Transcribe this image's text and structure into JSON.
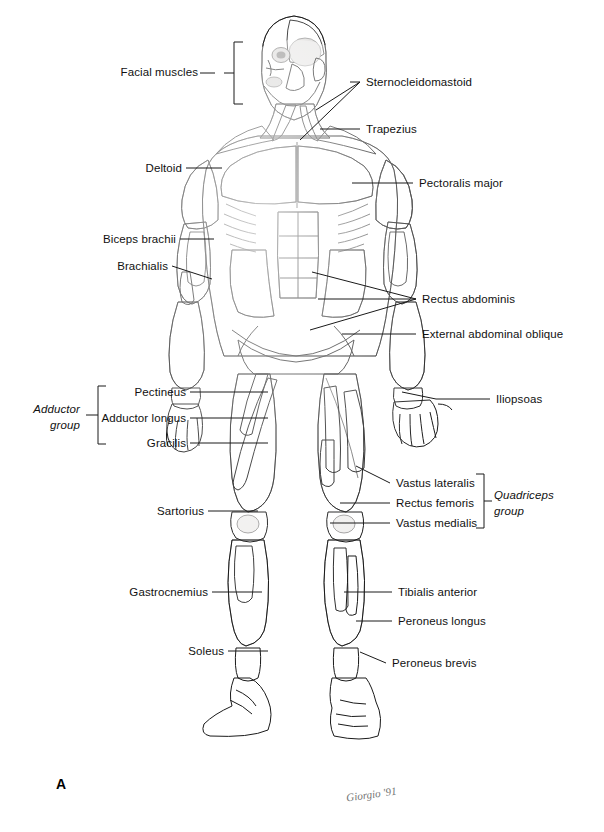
{
  "figure": {
    "panel_letter": "A",
    "view": "anterior",
    "signature": "Giorgio '91",
    "background_color": "#ffffff",
    "line_color": "#1a1a1a",
    "text_color": "#111111"
  },
  "labels_left": [
    {
      "id": "facial-muscles",
      "text": "Facial muscles",
      "x": 143,
      "y": 72,
      "type": "bracket"
    },
    {
      "id": "deltoid",
      "text": "Deltoid",
      "x": 140,
      "y": 164,
      "type": "line"
    },
    {
      "id": "biceps-brachii",
      "text": "Biceps brachii",
      "x": 101,
      "y": 235,
      "type": "line"
    },
    {
      "id": "brachialis",
      "text": "Brachialis",
      "x": 120,
      "y": 262,
      "type": "line"
    },
    {
      "id": "pectineus",
      "text": "Pectineus",
      "x": 129,
      "y": 389,
      "type": "line"
    },
    {
      "id": "adductor-longus",
      "text": "Adductor longus",
      "x": 90,
      "y": 415,
      "type": "line"
    },
    {
      "id": "gracilis",
      "text": "Gracilis",
      "x": 131,
      "y": 440,
      "type": "line"
    },
    {
      "id": "sartorius",
      "text": "Sartorius",
      "x": 158,
      "y": 508,
      "type": "line"
    },
    {
      "id": "gastrocnemius",
      "text": "Gastrocnemius",
      "x": 137,
      "y": 589,
      "type": "line"
    },
    {
      "id": "soleus",
      "text": "Soleus",
      "x": 194,
      "y": 648,
      "type": "line"
    }
  ],
  "labels_right": [
    {
      "id": "sternocleidomastoid",
      "text": "Sternocleidomastoid",
      "x": 366,
      "y": 81,
      "type": "line"
    },
    {
      "id": "trapezius",
      "text": "Trapezius",
      "x": 366,
      "y": 126,
      "type": "line"
    },
    {
      "id": "pectoralis-major",
      "text": "Pectoralis major",
      "x": 419,
      "y": 180,
      "type": "line"
    },
    {
      "id": "rectus-abdominis",
      "text": "Rectus abdominis",
      "x": 422,
      "y": 296,
      "type": "multi-line"
    },
    {
      "id": "external-abdominal-oblique",
      "text": "External abdominal oblique",
      "x": 422,
      "y": 331,
      "type": "line"
    },
    {
      "id": "iliopsoas",
      "text": "Iliopsoas",
      "x": 496,
      "y": 396,
      "type": "line"
    },
    {
      "id": "vastus-lateralis",
      "text": "Vastus lateralis",
      "x": 396,
      "y": 480,
      "type": "line"
    },
    {
      "id": "rectus-femoris",
      "text": "Rectus femoris",
      "x": 396,
      "y": 500,
      "type": "line"
    },
    {
      "id": "vastus-medialis",
      "text": "Vastus medialis",
      "x": 396,
      "y": 520,
      "type": "line"
    },
    {
      "id": "tibialis-anterior",
      "text": "Tibialis anterior",
      "x": 398,
      "y": 589,
      "type": "line"
    },
    {
      "id": "peroneus-longus",
      "text": "Peroneus longus",
      "x": 398,
      "y": 618,
      "type": "line"
    },
    {
      "id": "peroneus-brevis",
      "text": "Peroneus brevis",
      "x": 392,
      "y": 660,
      "type": "line"
    }
  ],
  "groups": [
    {
      "id": "adductor-group",
      "line1": "Adductor",
      "line2": "group",
      "x": 22,
      "y": 404,
      "side": "left"
    },
    {
      "id": "quadriceps-group",
      "line1": "Quadriceps",
      "line2": "group",
      "x": 494,
      "y": 490,
      "side": "right"
    }
  ]
}
